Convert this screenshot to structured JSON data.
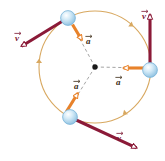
{
  "figure": {
    "type": "physics-vector-diagram",
    "width": 165,
    "height": 161,
    "background": "#ffffff"
  },
  "colors": {
    "circle_path": "#d8a860",
    "velocity_vector": "#8b1a38",
    "acceleration_vector": "#e8822a",
    "ball_fill": "#bcdcf0",
    "ball_edge": "#79b4d8",
    "center_dot": "#1a1a1a",
    "radius_dashed": "#9a9a9a",
    "label_v": "#7b1731",
    "label_a": "#3a2a14"
  },
  "geometry": {
    "circle": {
      "cx": 95,
      "cy": 67,
      "r": 56
    },
    "center_dot": {
      "cx": 95,
      "cy": 67,
      "r": 2.6
    }
  },
  "particles": [
    {
      "id": "particle-top-left",
      "position": {
        "x": 68,
        "y": 18
      },
      "radius": 7.5,
      "velocity": {
        "label": "v",
        "from": {
          "x": 66,
          "y": 19
        },
        "to": {
          "x": 17,
          "y": 49
        },
        "direction": "down-left tangent"
      },
      "acceleration": {
        "label": "a",
        "from": {
          "x": 72,
          "y": 24
        },
        "to": {
          "x": 84,
          "y": 44
        },
        "direction": "toward center"
      }
    },
    {
      "id": "particle-right",
      "position": {
        "x": 150,
        "y": 70
      },
      "radius": 7.5,
      "velocity": {
        "label": "v",
        "from": {
          "x": 150,
          "y": 64
        },
        "to": {
          "x": 150,
          "y": 9
        },
        "direction": "upward tangent"
      },
      "acceleration": {
        "label": "a",
        "from": {
          "x": 144,
          "y": 68
        },
        "to": {
          "x": 119,
          "y": 68
        },
        "direction": "toward center"
      }
    },
    {
      "id": "particle-bottom-left",
      "position": {
        "x": 70,
        "y": 117
      },
      "radius": 7.5,
      "velocity": {
        "label": "v",
        "from": {
          "x": 74,
          "y": 119
        },
        "to": {
          "x": 141,
          "y": 150
        },
        "direction": "down-right tangent"
      },
      "acceleration": {
        "label": "a",
        "from": {
          "x": 67,
          "y": 111
        },
        "to": {
          "x": 80,
          "y": 89
        },
        "direction": "toward center"
      }
    }
  ],
  "radius_lines": [
    {
      "from": {
        "x": 95,
        "y": 67
      },
      "to": {
        "x": 74,
        "y": 28
      }
    },
    {
      "from": {
        "x": 95,
        "y": 67
      },
      "to": {
        "x": 146,
        "y": 68
      }
    },
    {
      "from": {
        "x": 95,
        "y": 67
      },
      "to": {
        "x": 72,
        "y": 104
      }
    }
  ],
  "path_arrows": [
    {
      "at": {
        "x": 39,
        "y": 63
      },
      "angle": 270
    },
    {
      "at": {
        "x": 130,
        "y": 24
      },
      "angle": 35
    },
    {
      "at": {
        "x": 126,
        "y": 112
      },
      "angle": 140
    }
  ],
  "labels": {
    "velocity_top_left": {
      "text": "v",
      "x": 16,
      "y": 33
    },
    "velocity_right": {
      "text": "v",
      "x": 143,
      "y": 11
    },
    "velocity_bottom_right": {
      "text": "v",
      "x": 118,
      "y": 133
    },
    "acceleration_top": {
      "text": "a",
      "x": 87,
      "y": 36
    },
    "acceleration_right": {
      "text": "a",
      "x": 117,
      "y": 77
    },
    "acceleration_bottom": {
      "text": "a",
      "x": 75,
      "y": 81
    }
  }
}
